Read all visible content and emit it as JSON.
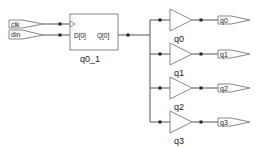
{
  "diagram": {
    "type": "rtl-schematic",
    "colors": {
      "wire": "#555555",
      "symbol": "#888888",
      "dot": "#222222",
      "text": "#222222",
      "background": "#ffffff"
    },
    "inputs": [
      {
        "name": "clk",
        "label": "clk"
      },
      {
        "name": "din",
        "label": "din"
      }
    ],
    "flipflop": {
      "instance": "q0_1",
      "d_pin": "D[0]",
      "q_pin": "Q[0]"
    },
    "buffers": [
      {
        "instance": "q0",
        "output": "q0"
      },
      {
        "instance": "q1",
        "output": "q1"
      },
      {
        "instance": "q2",
        "output": "q2"
      },
      {
        "instance": "q3",
        "output": "q3"
      }
    ]
  }
}
